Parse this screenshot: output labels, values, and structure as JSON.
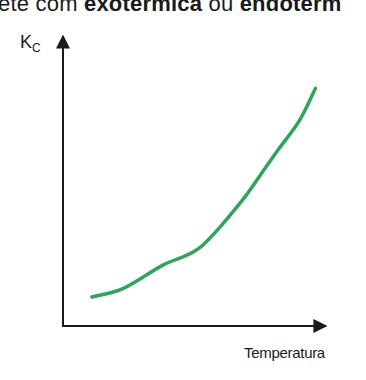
{
  "heading": {
    "prefix": "ete com ",
    "bold1": "exotérmica",
    "middle": " ou ",
    "bold2": "endotérm"
  },
  "chart_data": {
    "type": "line",
    "title": "",
    "xlabel": "Temperatura",
    "ylabel": "Kc",
    "ylabel_main": "K",
    "ylabel_sub": "C",
    "grid": false,
    "legend": null,
    "axis_ticks": false,
    "series": [
      {
        "name": "Kc vs Temperatura",
        "color": "#2ea55a",
        "shape": "increasing exponential-like curve",
        "x": [
          0.11,
          0.23,
          0.38,
          0.52,
          0.67,
          0.75,
          0.82,
          0.9,
          0.96
        ],
        "values": [
          0.1,
          0.13,
          0.21,
          0.27,
          0.42,
          0.52,
          0.61,
          0.71,
          0.82
        ]
      }
    ],
    "xlim": [
      0,
      1
    ],
    "ylim": [
      0,
      1
    ]
  },
  "colors": {
    "curve": "#2ea55a",
    "axis": "#1a1a1a"
  }
}
